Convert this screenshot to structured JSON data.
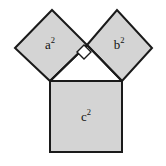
{
  "figure": {
    "name": "pythagorean-theorem-squares",
    "background_color": "#ffffff",
    "width": 166,
    "height": 166
  },
  "style": {
    "fill_color": "#d4d4d4",
    "stroke_color": "#1a1a1a",
    "stroke_width": 2,
    "marker_fill": "#ffffff",
    "label_color": "#111111"
  },
  "labels": {
    "square_a": {
      "base": "a",
      "exponent": "2",
      "x": 50,
      "y": 46
    },
    "square_b": {
      "base": "b",
      "exponent": "2",
      "x": 119,
      "y": 46
    },
    "square_c": {
      "base": "c",
      "exponent": "2",
      "x": 86,
      "y": 118
    }
  },
  "shapes": {
    "square_a": {
      "label": "a-squared-square",
      "points": "15,48 52,10 87,45 50,81"
    },
    "square_b": {
      "label": "b-squared-square",
      "points": "87,45 117,10 152,48 122,81"
    },
    "square_c": {
      "label": "c-squared-square",
      "points": "50,81 122,81 122,152 50,152"
    },
    "right_angle_marker": {
      "label": "right-angle-marker",
      "points": "84,45 91,52 84,59 77,52"
    },
    "triangle": {
      "label": "right-triangle",
      "points": "50,81 87,45 122,81"
    }
  }
}
